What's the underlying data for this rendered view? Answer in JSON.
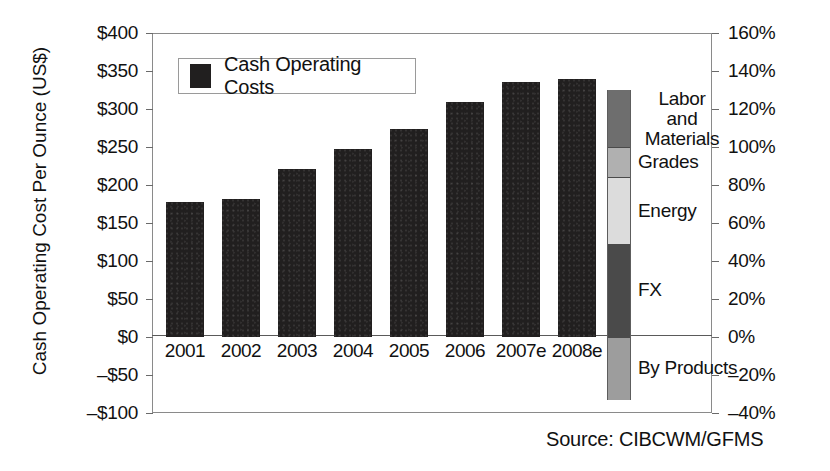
{
  "chart_data": {
    "type": "bar",
    "title": "",
    "xlabel": "",
    "ylabel": "Cash Operating Cost Per Ounce (US$)",
    "categories": [
      "2001",
      "2002",
      "2003",
      "2004",
      "2005",
      "2006",
      "2007e",
      "2008e"
    ],
    "values": [
      177,
      181,
      221,
      247,
      274,
      309,
      335,
      340
    ],
    "ylim": [
      -100,
      400
    ],
    "ytick_labels": [
      "$400",
      "$350",
      "$300",
      "$250",
      "$200",
      "$150",
      "$100",
      "$50",
      "$0",
      "–$50",
      "–$100"
    ],
    "ytick_values": [
      400,
      350,
      300,
      250,
      200,
      150,
      100,
      50,
      0,
      -50,
      -100
    ],
    "y2lim": [
      -40,
      160
    ],
    "y2tick_labels": [
      "160%",
      "140%",
      "120%",
      "100%",
      "80%",
      "60%",
      "40%",
      "20%",
      "0%",
      "–20%",
      "–40%"
    ],
    "y2tick_values": [
      160,
      140,
      120,
      100,
      80,
      60,
      40,
      20,
      0,
      -20,
      -40
    ],
    "grid": false,
    "legend": {
      "position": "top-left",
      "entries": [
        {
          "label": "Cash Operating Costs",
          "color": "#211f1f"
        }
      ]
    },
    "cost_breakdown": {
      "note": "Stacked contribution bar plotted against the right-hand percentage axis",
      "segments": [
        {
          "label": "Labor and Materials",
          "from_pct": 100,
          "to_pct": 130,
          "value_pct": 30,
          "color": "#6e6e6e"
        },
        {
          "label": "Grades",
          "from_pct": 84,
          "to_pct": 100,
          "value_pct": 16,
          "color": "#b0b0b0"
        },
        {
          "label": "Energy",
          "from_pct": 49,
          "to_pct": 84,
          "value_pct": 35,
          "color": "#dcdcdc"
        },
        {
          "label": "FX",
          "from_pct": 0,
          "to_pct": 49,
          "value_pct": 49,
          "color": "#4a4a4a"
        },
        {
          "label": "By Products",
          "from_pct": -33,
          "to_pct": 0,
          "value_pct": -33,
          "color": "#9d9d9d"
        }
      ]
    },
    "source": "Source: CIBCWM/GFMS"
  },
  "axis": {
    "left_title": "Cash Operating Cost Per Ounce (US$)"
  },
  "legend": {
    "label": "Cash Operating Costs"
  },
  "footer": {
    "source": "Source: CIBCWM/GFMS"
  }
}
